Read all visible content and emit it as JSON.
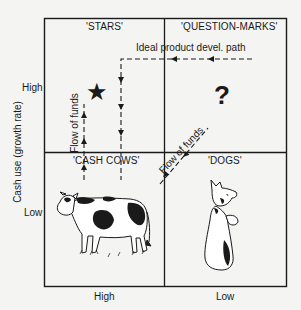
{
  "diagram": {
    "type": "BCG growth-share matrix",
    "y_axis": {
      "label": "Cash use (growth rate)",
      "ticks": [
        "High",
        "Low"
      ]
    },
    "x_axis": {
      "ticks": [
        "High",
        "Low"
      ]
    },
    "quadrants": {
      "stars": {
        "title": "'STARS'",
        "symbol": "★",
        "symbol_name": "star"
      },
      "question_marks": {
        "title": "'QUESTION-MARKS'",
        "symbol": "?",
        "symbol_name": "question-mark"
      },
      "cash_cows": {
        "title": "'CASH COWS'",
        "illustration": "cow"
      },
      "dogs": {
        "title": "'DOGS'",
        "illustration": "dog"
      }
    },
    "annotations": {
      "ideal_path": "Ideal product devel. path",
      "flow_funds_vertical": "Flow of funds",
      "flow_funds_diagonal": "Flow of funds"
    },
    "colors": {
      "ink": "#1a1a1a",
      "paper": "#f4f4f2"
    }
  }
}
